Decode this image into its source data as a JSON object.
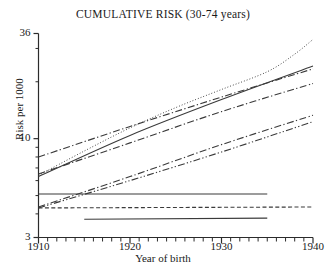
{
  "chart_data": {
    "type": "line",
    "title": "CUMULATIVE RISK (30-74 years)",
    "xlabel": "Year of birth",
    "ylabel": "Risk per 1000",
    "xlim": [
      1910,
      1940
    ],
    "ylim": [
      3,
      36
    ],
    "yscale": "log",
    "grid": false,
    "legend": "none",
    "xticks": [
      1910,
      1920,
      1930,
      1940
    ],
    "xtick_labels": [
      "1910",
      "1920",
      "1930",
      "1940"
    ],
    "xminor_step": 1,
    "yticks": [
      3,
      10,
      36
    ],
    "ytick_labels": [
      "3",
      "10",
      "36"
    ],
    "yminor_ticks": [
      4,
      5,
      6,
      7,
      8,
      9,
      20,
      30
    ],
    "series": [
      {
        "name": "dotted-rising-curve",
        "style": "dotted",
        "x": [
          1910,
          1915,
          1920,
          1925,
          1930,
          1935,
          1938,
          1940
        ],
        "values": [
          6.4,
          8.6,
          11.4,
          14.6,
          18.2,
          22.6,
          28.0,
          33.5
        ]
      },
      {
        "name": "solid-rising",
        "style": "solid",
        "x": [
          1910,
          1920,
          1930,
          1940
        ],
        "values": [
          6.3,
          10.4,
          16.1,
          24.2
        ]
      },
      {
        "name": "dashdot-upper",
        "style": "dashdot",
        "x": [
          1910,
          1920,
          1930,
          1940
        ],
        "values": [
          8.0,
          11.6,
          16.6,
          23.4
        ]
      },
      {
        "name": "dashdot-mid",
        "style": "dashdot",
        "x": [
          1910,
          1920,
          1930,
          1940
        ],
        "values": [
          6.5,
          9.5,
          13.9,
          19.6
        ]
      },
      {
        "name": "dashdot-lower",
        "style": "dashdot",
        "x": [
          1910,
          1920,
          1930,
          1940
        ],
        "values": [
          4.35,
          6.3,
          9.3,
          13.3
        ]
      },
      {
        "name": "dashdotdot-lowest",
        "style": "dashdotdot",
        "x": [
          1910,
          1920,
          1930,
          1940
        ],
        "values": [
          4.3,
          6.0,
          8.5,
          12.3
        ]
      },
      {
        "name": "flat-solid-upper",
        "style": "solid",
        "x": [
          1910,
          1935
        ],
        "values": [
          5.1,
          5.1
        ]
      },
      {
        "name": "flat-dashed",
        "style": "dashed",
        "x": [
          1910,
          1940
        ],
        "values": [
          4.3,
          4.35
        ]
      },
      {
        "name": "flat-solid-lower",
        "style": "solid",
        "x": [
          1915,
          1935
        ],
        "values": [
          3.75,
          3.8
        ]
      }
    ]
  },
  "axes": {
    "title": "CUMULATIVE RISK (30-74 years)",
    "ylabel": "Risk per 1000",
    "xlabel": "Year of birth"
  }
}
